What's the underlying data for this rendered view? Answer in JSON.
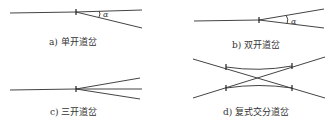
{
  "figure": {
    "panels": [
      {
        "id": "a",
        "caption": "a) 单开道岔",
        "angle_label": "α"
      },
      {
        "id": "b",
        "caption": "b) 双开道岔",
        "angle_label": "α"
      },
      {
        "id": "c",
        "caption": "c) 三开道岔"
      },
      {
        "id": "d",
        "caption": "d) 复式交分道岔"
      }
    ],
    "colors": {
      "line": "#444444",
      "text": "#333333",
      "background": "#ffffff"
    }
  }
}
